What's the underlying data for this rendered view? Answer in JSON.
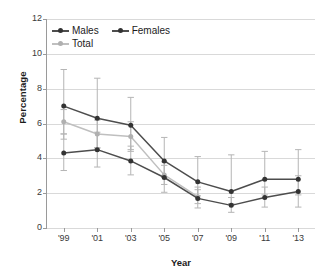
{
  "chart_data": {
    "type": "line",
    "title": "",
    "xlabel": "Year",
    "ylabel": "Percentage",
    "categories": [
      "'99",
      "'01",
      "'03",
      "'05",
      "'07",
      "'09",
      "'11",
      "'13"
    ],
    "x": [
      1999,
      2001,
      2003,
      2005,
      2007,
      2009,
      2011,
      2013
    ],
    "ylim": [
      0,
      12
    ],
    "yticks": [
      0,
      2,
      4,
      6,
      8,
      10,
      12
    ],
    "grid": "horizontal",
    "legend_position": "top-left",
    "error_bars": "95% confidence interval",
    "series": [
      {
        "name": "Males",
        "color": "#4d4d4d",
        "values": [
          7.0,
          6.3,
          5.9,
          3.85,
          2.65,
          2.1,
          2.8,
          2.8
        ],
        "err_low": [
          5.1,
          4.6,
          4.5,
          2.9,
          1.85,
          1.4,
          1.9,
          1.9
        ],
        "err_high": [
          9.1,
          8.6,
          7.5,
          5.2,
          4.1,
          4.2,
          4.4,
          4.5
        ]
      },
      {
        "name": "Females",
        "color": "#4d4d4d",
        "values": [
          4.3,
          4.5,
          3.85,
          2.9,
          1.7,
          1.3,
          1.75,
          2.1
        ],
        "err_low": [
          3.3,
          3.5,
          3.05,
          2.05,
          1.15,
          0.9,
          1.2,
          1.2
        ],
        "err_high": [
          5.4,
          5.5,
          4.7,
          3.8,
          2.35,
          1.75,
          2.35,
          3.0
        ]
      },
      {
        "name": "Total",
        "color": "#bfbfbf",
        "values": [
          6.1,
          5.4,
          5.25,
          3.05,
          1.8,
          null,
          null,
          null
        ],
        "err_low": [
          5.4,
          4.6,
          4.4,
          2.5,
          1.4,
          null,
          null,
          null
        ],
        "err_high": [
          6.8,
          6.2,
          6.1,
          3.6,
          2.2,
          null,
          null,
          null
        ]
      }
    ]
  },
  "legend": {
    "items": [
      {
        "label": "Males",
        "color": "#4d4d4d"
      },
      {
        "label": "Females",
        "color": "#4d4d4d"
      },
      {
        "label": "Total",
        "color": "#bfbfbf"
      }
    ]
  },
  "axes": {
    "y_title": "Percentage",
    "x_title": "Year",
    "y_ticks": [
      "12",
      "10",
      "8",
      "6",
      "4",
      "2",
      "0"
    ],
    "x_ticks": [
      "'99",
      "'01",
      "'03",
      "'05",
      "'07",
      "'09",
      "'11",
      "'13"
    ]
  }
}
